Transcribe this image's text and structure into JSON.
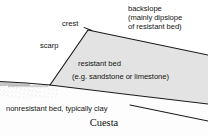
{
  "figure": {
    "caption": "Cuesta",
    "labels": {
      "backslope_line1": "backslope",
      "backslope_line2": "(mainly dipslope",
      "backslope_line3": "of resistant bed)",
      "crest": "crest",
      "scarp": "scarp",
      "resistant_bed": "resistant bed",
      "resistant_bed_examples": "(e.g. sandstone or limestone)",
      "nonresistant_bed": "nonresistant bed, typically clay"
    },
    "colors": {
      "line": "#1a1a1a",
      "resistant_fill": "#e2e2e2",
      "clay_fill": "#fbfbfb",
      "stipple": "#8a8a8a",
      "background": "#ffffff",
      "text": "#141414"
    },
    "geometry": {
      "crest_apex": [
        88,
        30
      ],
      "backslope_right_end": [
        208,
        55
      ],
      "scarp_base": [
        50,
        85
      ],
      "ground_left_end": [
        0,
        82
      ],
      "bed_base_right_end": [
        208,
        104
      ],
      "clay_surface_right_end": [
        208,
        118
      ]
    }
  }
}
